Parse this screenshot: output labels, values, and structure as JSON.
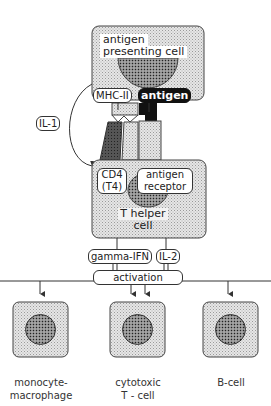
{
  "diagram": {
    "apc": {
      "label_line1": "antigen",
      "label_line2": "presenting cell"
    },
    "mhc_label": "MHC-II",
    "antigen_label": "antigen",
    "il1_label": "IL-1",
    "thelper": {
      "cd4_line1": "CD4",
      "cd4_line2": "(T4)",
      "receptor_line1": "antigen",
      "receptor_line2": "receptor",
      "label_line1": "T helper",
      "label_line2": "cell"
    },
    "gamma_ifn_label": "gamma-IFN",
    "il2_label": "IL-2",
    "activation_label": "activation",
    "targets": [
      {
        "line1": "monocyte-",
        "line2": "macrophage"
      },
      {
        "line1": "cytotoxic",
        "line2": "T - cell"
      },
      {
        "line1": "B-cell",
        "line2": ""
      }
    ],
    "colors": {
      "cell_fill": "#d9d9d9",
      "nucleus_fill": "#7a7a7a",
      "dark": "#111111",
      "line": "#333333"
    }
  }
}
